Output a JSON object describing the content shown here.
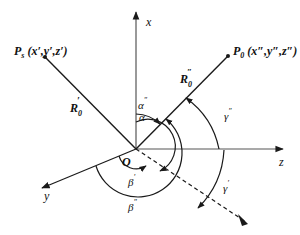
{
  "diagram": {
    "type": "3D coordinate system with angular parameters",
    "origin": {
      "label": "O"
    },
    "axes": [
      {
        "name": "x",
        "label": "x",
        "direction": "up"
      },
      {
        "name": "y",
        "label": "y",
        "direction": "lower-left"
      },
      {
        "name": "z",
        "label": "z",
        "direction": "right"
      }
    ],
    "points": [
      {
        "id": "Ps",
        "label": "P",
        "subscript": "s",
        "coords": "(x′,y′,z′)"
      },
      {
        "id": "P0",
        "label": "P",
        "subscript": "0",
        "coords": "(x″,y″,z″)"
      }
    ],
    "vectors": [
      {
        "id": "R0-prime",
        "label": "R",
        "subscript": "0",
        "superscript": "′"
      },
      {
        "id": "R0-double",
        "label": "R",
        "subscript": "0",
        "superscript": "″"
      }
    ],
    "angles": [
      {
        "id": "alpha-prime",
        "label": "α′"
      },
      {
        "id": "alpha-double",
        "label": "α″"
      },
      {
        "id": "beta-prime",
        "label": "β′"
      },
      {
        "id": "beta-double",
        "label": "β″"
      },
      {
        "id": "gamma-prime",
        "label": "γ′"
      },
      {
        "id": "gamma-double",
        "label": "γ″"
      }
    ],
    "colors": {
      "stroke": "#1a1a1a",
      "background": "#ffffff"
    }
  },
  "labels": {
    "x": "x",
    "y": "y",
    "z": "z",
    "O": "O",
    "Ps_main": "P",
    "Ps_sub": "s",
    "Ps_coords": "(x′,y′,z′)",
    "P0_main": "P",
    "P0_sub": "0",
    "P0_coords": "(x″,y″,z″)",
    "R_main": "R",
    "R_sub": "0",
    "R1_sup": "′",
    "R2_sup": "″",
    "alpha1": "α",
    "alpha1_sup": "′",
    "alpha2": "α",
    "alpha2_sup": "″",
    "beta1": "β",
    "beta1_sup": "′",
    "beta2": "β",
    "beta2_sup": "″",
    "gamma1": "γ",
    "gamma1_sup": "′",
    "gamma2": "γ",
    "gamma2_sup": "″"
  }
}
